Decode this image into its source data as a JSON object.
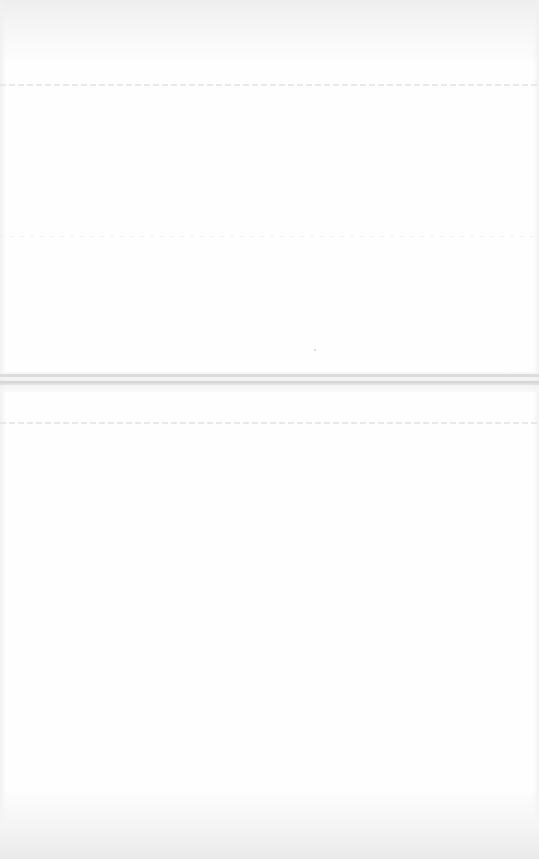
{
  "page": {
    "background": "#fefefe",
    "content_legible": false
  },
  "colors": {
    "top_band": "#eeeeee",
    "separator": "#d2d2d2",
    "dotted_line": "#e6e6e6",
    "vignette": "#eaeaea"
  }
}
